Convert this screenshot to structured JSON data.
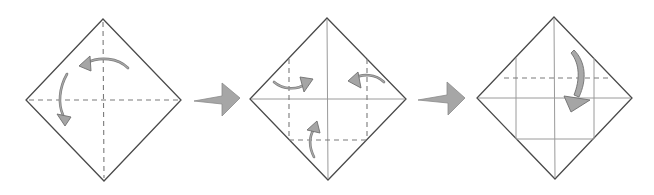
{
  "diagram": {
    "type": "origami-folding-sequence",
    "steps": [
      {
        "index": 1,
        "shape": "square-paper-diamond",
        "creases": [
          "vertical-center-dashed",
          "horizontal-center-dashed"
        ],
        "fold_arrows": [
          "curved-arrow-left",
          "curved-arrow-down"
        ],
        "description": "Fold in half both ways and unfold"
      },
      {
        "index": 2,
        "shape": "square-paper-diamond",
        "creases": [
          "vertical-center-solid",
          "horizontal-center-solid",
          "left-vertical-dashed",
          "right-vertical-dashed",
          "bottom-horizontal-dashed"
        ],
        "fold_arrows": [
          "curved-arrow-right",
          "curved-arrow-left",
          "curved-arrow-up"
        ],
        "description": "Fold left, right and bottom corners to the center"
      },
      {
        "index": 3,
        "shape": "square-paper-diamond",
        "creases": [
          "vertical-center-solid",
          "horizontal-center-solid",
          "left-vertical-solid",
          "right-vertical-solid",
          "bottom-horizontal-solid",
          "top-horizontal-dashed"
        ],
        "fold_arrows": [
          "curved-arrow-down"
        ],
        "description": "Fold the top corner down"
      }
    ],
    "step_arrows": [
      {
        "from": 1,
        "to": 2,
        "icon": "right-arrow"
      },
      {
        "from": 2,
        "to": 3,
        "icon": "right-arrow"
      }
    ],
    "colors": {
      "outline": "#4a4a4a",
      "crease": "#9a9a9a",
      "valley_fold": "#7a7a7a",
      "arrow_fill": "#a6a6a6",
      "background": "#ffffff"
    }
  }
}
